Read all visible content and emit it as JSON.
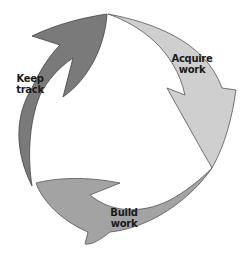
{
  "diagram": {
    "type": "cycle",
    "colors": {
      "keep_track": "#7a7a7a",
      "acquire_work": "#cfcfcf",
      "build_work": "#a3a3a3",
      "outline": "#555555",
      "text": "#1a1a1a"
    },
    "steps": [
      {
        "line1": "Keep",
        "line2": "track"
      },
      {
        "line1": "Acquire",
        "line2": "work"
      },
      {
        "line1": "Build",
        "line2": "work"
      }
    ]
  }
}
